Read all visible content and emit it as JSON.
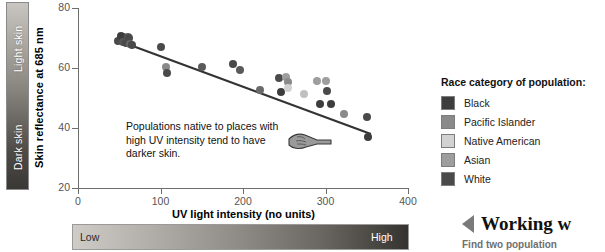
{
  "skin_scale": {
    "top_label": "Light skin",
    "bottom_label": "Dark skin"
  },
  "uv_scale": {
    "low_label": "Low",
    "high_label": "High"
  },
  "legend": {
    "title": "Race category of population:",
    "items": [
      {
        "label": "Black",
        "color": "#3d3d3d"
      },
      {
        "label": "Pacific Islander",
        "color": "#8a8a8a"
      },
      {
        "label": "Native American",
        "color": "#d2d2d2"
      },
      {
        "label": "Asian",
        "color": "#9e9e9e"
      },
      {
        "label": "White",
        "color": "#4a4a4a"
      }
    ]
  },
  "annotation": {
    "text": "Populations native to places with high UV intensity tend to have darker skin.",
    "icon": "pointing-hand-icon"
  },
  "sidebar": {
    "title": "Working w",
    "subtitle": "Find two population"
  },
  "chart_data": {
    "type": "scatter",
    "title": "",
    "xlabel": "UV light intensity (no units)",
    "ylabel": "Skin reflectance at 685 nm",
    "xlim": [
      0,
      400
    ],
    "ylim": [
      20,
      80
    ],
    "xticks": [
      0,
      100,
      200,
      300,
      400
    ],
    "yticks": [
      20,
      40,
      60,
      80
    ],
    "grid": false,
    "legend_position": "right",
    "trendline": {
      "x": [
        45,
        355
      ],
      "y": [
        69.5,
        38.0
      ],
      "color": "#333333"
    },
    "points": [
      {
        "x": 48,
        "y": 69.0,
        "color": "#4a4a4a"
      },
      {
        "x": 52,
        "y": 70.8,
        "color": "#3d3d3d"
      },
      {
        "x": 54,
        "y": 70.3,
        "color": "#3d3d3d"
      },
      {
        "x": 55,
        "y": 68.6,
        "color": "#555555"
      },
      {
        "x": 58,
        "y": 68.2,
        "color": "#4a4a4a"
      },
      {
        "x": 60,
        "y": 70.4,
        "color": "#5a5a5a"
      },
      {
        "x": 62,
        "y": 70.1,
        "color": "#4a4a4a"
      },
      {
        "x": 63,
        "y": 68.1,
        "color": "#666666"
      },
      {
        "x": 66,
        "y": 67.8,
        "color": "#4a4a4a"
      },
      {
        "x": 100,
        "y": 67.0,
        "color": "#4a4a4a"
      },
      {
        "x": 107,
        "y": 60.2,
        "color": "#8a8a8a"
      },
      {
        "x": 108,
        "y": 58.2,
        "color": "#4a4a4a"
      },
      {
        "x": 150,
        "y": 60.5,
        "color": "#5a5a5a"
      },
      {
        "x": 188,
        "y": 61.5,
        "color": "#4a4a4a"
      },
      {
        "x": 196,
        "y": 59.3,
        "color": "#5a5a5a"
      },
      {
        "x": 221,
        "y": 52.8,
        "color": "#6a6a6a"
      },
      {
        "x": 244,
        "y": 56.8,
        "color": "#4a4a4a"
      },
      {
        "x": 246,
        "y": 52.0,
        "color": "#3d3d3d"
      },
      {
        "x": 252,
        "y": 56.9,
        "color": "#9e9e9e"
      },
      {
        "x": 254,
        "y": 55.2,
        "color": "#8a8a8a"
      },
      {
        "x": 255,
        "y": 53.4,
        "color": "#d2d2d2"
      },
      {
        "x": 274,
        "y": 51.4,
        "color": "#c0c0c0"
      },
      {
        "x": 290,
        "y": 55.8,
        "color": "#9e9e9e"
      },
      {
        "x": 293,
        "y": 48.0,
        "color": "#3d3d3d"
      },
      {
        "x": 300,
        "y": 55.8,
        "color": "#9e9e9e"
      },
      {
        "x": 302,
        "y": 52.2,
        "color": "#4a4a4a"
      },
      {
        "x": 307,
        "y": 48.0,
        "color": "#3d3d3d"
      },
      {
        "x": 322,
        "y": 44.8,
        "color": "#8a8a8a"
      },
      {
        "x": 350,
        "y": 43.6,
        "color": "#4a4a4a"
      },
      {
        "x": 351,
        "y": 37.0,
        "color": "#3d3d3d"
      }
    ]
  }
}
